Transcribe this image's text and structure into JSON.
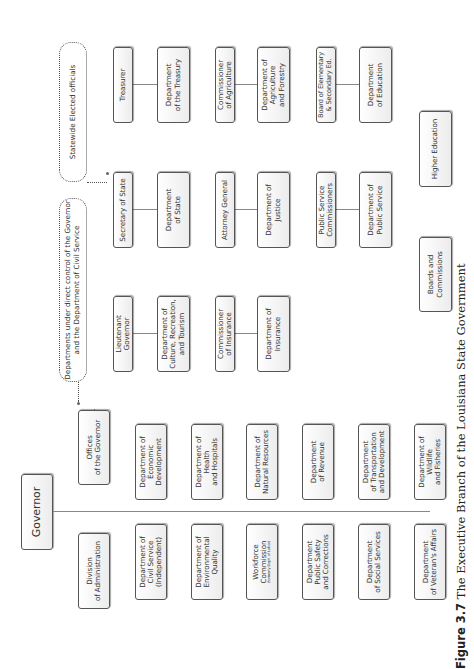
{
  "caption": {
    "label": "Figure 3.7",
    "text": "The Executive Branch of the Louisiana State Government"
  },
  "governor": {
    "title": "Governor",
    "offices": "Offices\nof the Governor",
    "division": "Division\nof Administration",
    "departments_right": [
      "Department of\nEconomic\nDevelopment",
      "Department of\nHealth\nand Hospitals",
      "Department of\nNatural Resources",
      "Department\nof Revenue",
      "Department\nof Transportation\nand Development",
      "Department of\nWildlife\nand Fisheries"
    ],
    "departments_left": [
      "Department of\nCivil Service\n(Independent)",
      "Department of\nEnvironmental\nQuality",
      "Workforce\nCommission",
      "Department\nPublic Safety\nand Corrections",
      "Department\nof Social Services",
      "Department\nof Veteran's Affairs"
    ],
    "workforce_note": "(formerly Dept. of Labor)"
  },
  "legends": {
    "direct_control": "Departments under direct control of the Governor\nand the Department of Civil Service",
    "statewide": "Statewide Elected officials"
  },
  "elected": [
    {
      "official": "Lieutenant\nGovernor",
      "department": "Department of\nCulture, Recreation,\nand Tourism"
    },
    {
      "official": "Commissioner\nof Insurance",
      "department": "Department of\nInsurance"
    },
    {
      "official": "Secretary of State",
      "department": "Department\nof State"
    },
    {
      "official": "Attorney General",
      "department": "Department of\nJustice"
    },
    {
      "official": "Public Service\nCommissioners",
      "department": "Department of\nPublic Service"
    },
    {
      "official": "Treasurer",
      "department": "Department\nof the Treasury"
    },
    {
      "official": "Commissioner\nof Agriculture",
      "department": "Department of\nAgriculture\nand Forestry"
    },
    {
      "official": "Board of Elementary\n& Secondary Ed.",
      "department": "Department\nof Education"
    }
  ],
  "other": {
    "boards": "Boards and\nCommissions",
    "higher_ed": "Higher Education"
  },
  "colors": {
    "border": "#555555",
    "connector": "#888888",
    "box_fill": "#f4f4f4"
  }
}
